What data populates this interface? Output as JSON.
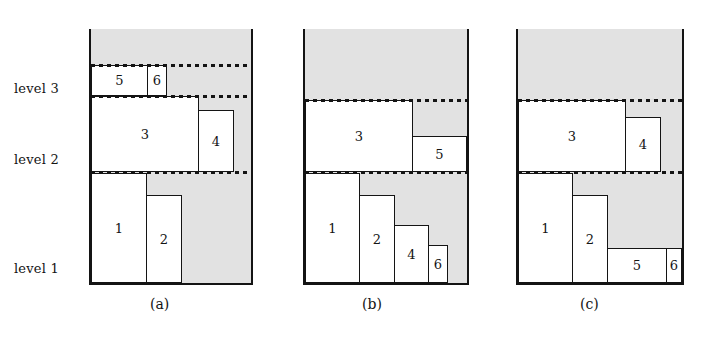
{
  "figure": {
    "background_color": "#ffffff",
    "line_color": "#141414",
    "shade_color": "#e2e2e2",
    "box_fill_color": "#ffffff"
  },
  "level_labels": [
    {
      "text": "level 3",
      "x": 14,
      "y": 81
    },
    {
      "text": "level 2",
      "x": 14,
      "y": 152
    },
    {
      "text": "level 1",
      "x": 14,
      "y": 261
    }
  ],
  "panels": [
    {
      "id": "a",
      "caption": "(a)",
      "caption_x": 150,
      "caption_y": 296,
      "frame": {
        "x": 91,
        "y": 29,
        "width": 160,
        "height": 254
      },
      "shade": {
        "x": 91,
        "y": 29,
        "width": 160,
        "height": 254
      },
      "dotted_lines": [
        {
          "x": 91,
          "y": 64,
          "width": 160
        },
        {
          "x": 91,
          "y": 95,
          "width": 160
        },
        {
          "x": 91,
          "y": 171,
          "width": 160
        }
      ],
      "boxes": [
        {
          "label": "1",
          "x": 91,
          "y": 173,
          "width": 56,
          "height": 110
        },
        {
          "label": "2",
          "x": 146,
          "y": 195,
          "width": 36,
          "height": 88
        },
        {
          "label": "3",
          "x": 91,
          "y": 96,
          "width": 108,
          "height": 76
        },
        {
          "label": "4",
          "x": 198,
          "y": 110,
          "width": 36,
          "height": 62
        },
        {
          "label": "5",
          "x": 91,
          "y": 65,
          "width": 57,
          "height": 31
        },
        {
          "label": "6",
          "x": 147,
          "y": 65,
          "width": 20,
          "height": 31
        }
      ]
    },
    {
      "id": "b",
      "caption": "(b)",
      "caption_x": 362,
      "caption_y": 296,
      "frame": {
        "x": 305,
        "y": 29,
        "width": 162,
        "height": 254
      },
      "shade": {
        "x": 305,
        "y": 29,
        "width": 162,
        "height": 254
      },
      "dotted_lines": [
        {
          "x": 305,
          "y": 99,
          "width": 162
        },
        {
          "x": 305,
          "y": 171,
          "width": 162
        }
      ],
      "boxes": [
        {
          "label": "1",
          "x": 305,
          "y": 173,
          "width": 55,
          "height": 110
        },
        {
          "label": "2",
          "x": 359,
          "y": 195,
          "width": 36,
          "height": 88
        },
        {
          "label": "3",
          "x": 305,
          "y": 100,
          "width": 108,
          "height": 72
        },
        {
          "label": "4",
          "x": 394,
          "y": 225,
          "width": 35,
          "height": 58
        },
        {
          "label": "5",
          "x": 412,
          "y": 136,
          "width": 55,
          "height": 36
        },
        {
          "label": "6",
          "x": 428,
          "y": 245,
          "width": 20,
          "height": 38
        }
      ]
    },
    {
      "id": "c",
      "caption": "(c)",
      "caption_x": 580,
      "caption_y": 296,
      "frame": {
        "x": 518,
        "y": 29,
        "width": 164,
        "height": 254
      },
      "shade": {
        "x": 518,
        "y": 29,
        "width": 164,
        "height": 254
      },
      "dotted_lines": [
        {
          "x": 518,
          "y": 99,
          "width": 164
        },
        {
          "x": 518,
          "y": 171,
          "width": 164
        }
      ],
      "boxes": [
        {
          "label": "1",
          "x": 518,
          "y": 173,
          "width": 55,
          "height": 110
        },
        {
          "label": "2",
          "x": 572,
          "y": 195,
          "width": 36,
          "height": 88
        },
        {
          "label": "3",
          "x": 518,
          "y": 100,
          "width": 108,
          "height": 72
        },
        {
          "label": "4",
          "x": 625,
          "y": 117,
          "width": 36,
          "height": 55
        },
        {
          "label": "5",
          "x": 607,
          "y": 248,
          "width": 60,
          "height": 35
        },
        {
          "label": "6",
          "x": 666,
          "y": 248,
          "width": 16,
          "height": 35
        }
      ]
    }
  ]
}
